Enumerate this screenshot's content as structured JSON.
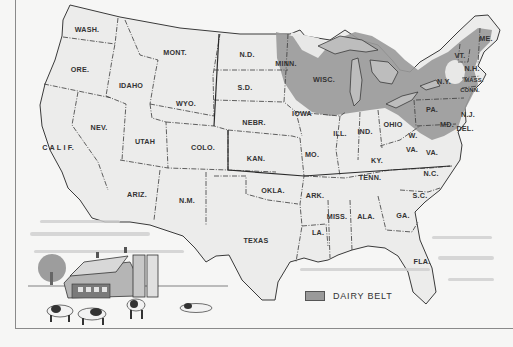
{
  "map": {
    "title": "Dairy Belt of the United States",
    "colors": {
      "paper": "#f6f6f5",
      "land": "#ececeb",
      "dairy_belt": "#9a9a9a",
      "border": "#3a3a3a",
      "label": "#333333"
    },
    "states": [
      {
        "label": "WASH.",
        "x": 87,
        "y": 32
      },
      {
        "label": "ORE.",
        "x": 80,
        "y": 72
      },
      {
        "label": "IDAHO",
        "x": 131,
        "y": 88
      },
      {
        "label": "MONT.",
        "x": 175,
        "y": 55
      },
      {
        "label": "WYO.",
        "x": 186,
        "y": 106
      },
      {
        "label": "N.D.",
        "x": 247,
        "y": 57
      },
      {
        "label": "S.D.",
        "x": 245,
        "y": 90
      },
      {
        "label": "NEBR.",
        "x": 254,
        "y": 125
      },
      {
        "label": "KAN.",
        "x": 256,
        "y": 161
      },
      {
        "label": "NEV.",
        "x": 99,
        "y": 130
      },
      {
        "label": "UTAH",
        "x": 145,
        "y": 144
      },
      {
        "label": "COLO.",
        "x": 203,
        "y": 150
      },
      {
        "label": "C A L I F.",
        "x": 58,
        "y": 150
      },
      {
        "label": "ARIZ.",
        "x": 137,
        "y": 197
      },
      {
        "label": "N.M.",
        "x": 187,
        "y": 203
      },
      {
        "label": "OKLA.",
        "x": 273,
        "y": 193
      },
      {
        "label": "TEXAS",
        "x": 256,
        "y": 243
      },
      {
        "label": "MINN.",
        "x": 286,
        "y": 66
      },
      {
        "label": "WISC.",
        "x": 324,
        "y": 82
      },
      {
        "label": "IOWA",
        "x": 302,
        "y": 116
      },
      {
        "label": "ILL.",
        "x": 340,
        "y": 136
      },
      {
        "label": "IND.",
        "x": 365,
        "y": 134
      },
      {
        "label": "OHIO",
        "x": 393,
        "y": 127
      },
      {
        "label": "MO.",
        "x": 312,
        "y": 157
      },
      {
        "label": "KY.",
        "x": 377,
        "y": 163
      },
      {
        "label": "ARK.",
        "x": 315,
        "y": 198
      },
      {
        "label": "TENN.",
        "x": 370,
        "y": 180
      },
      {
        "label": "MISS.",
        "x": 337,
        "y": 219
      },
      {
        "label": "ALA.",
        "x": 366,
        "y": 219
      },
      {
        "label": "GA.",
        "x": 403,
        "y": 218
      },
      {
        "label": "LA.",
        "x": 318,
        "y": 235
      },
      {
        "label": "FLA.",
        "x": 422,
        "y": 264
      },
      {
        "label": "N.C.",
        "x": 431,
        "y": 176
      },
      {
        "label": "S.C.",
        "x": 420,
        "y": 198
      },
      {
        "label": "VA.",
        "x": 432,
        "y": 155
      },
      {
        "label": "W.",
        "x": 413,
        "y": 138
      },
      {
        "label": "VA.",
        "x": 412,
        "y": 152
      },
      {
        "label": "PA.",
        "x": 432,
        "y": 112
      },
      {
        "label": "N.Y.",
        "x": 444,
        "y": 84
      },
      {
        "label": "VT.",
        "x": 460,
        "y": 58
      },
      {
        "label": "N.H.",
        "x": 472,
        "y": 71
      },
      {
        "label": "MASS.",
        "x": 474,
        "y": 82
      },
      {
        "label": "CONN.",
        "x": 470,
        "y": 92
      },
      {
        "label": "ME.",
        "x": 486,
        "y": 41
      },
      {
        "label": "N.J.",
        "x": 468,
        "y": 117
      },
      {
        "label": "MD.",
        "x": 447,
        "y": 127
      },
      {
        "label": "DEL.",
        "x": 465,
        "y": 131
      }
    ],
    "legend": {
      "label": "DAIRY BELT"
    },
    "illustration": "farm-scene-barn-silos-cows"
  }
}
